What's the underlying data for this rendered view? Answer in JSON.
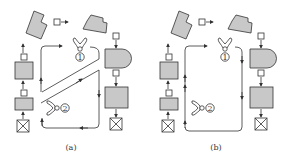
{
  "figure": {
    "panels": [
      {
        "id": "a",
        "caption": "(a)",
        "robots": [
          {
            "label": "1"
          },
          {
            "label": "2"
          }
        ],
        "description": "Two robots with diagonal divided loop paths"
      },
      {
        "id": "b",
        "caption": "(b)",
        "robots": [
          {
            "label": "1"
          },
          {
            "label": "2"
          }
        ],
        "description": "Two robots sharing single rectangular loop path"
      }
    ],
    "colors": {
      "machine_fill": "#c8c8c8",
      "stroke": "#333333",
      "background": "#ffffff"
    }
  }
}
